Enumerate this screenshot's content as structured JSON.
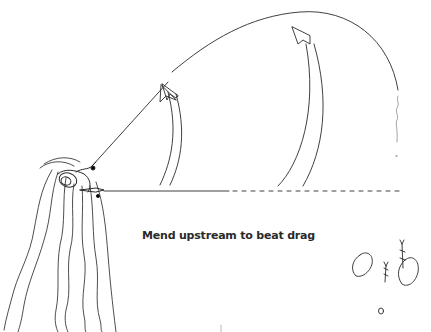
{
  "diagram": {
    "caption": "Mend upstream to beat drag",
    "colors": {
      "background": "#ffffff",
      "ink": "#2a2a2a",
      "faint_ink": "#777777"
    },
    "elements": [
      "angler-in-water",
      "fly-line-cast-arc",
      "mend-arrow-left",
      "mend-arrow-right",
      "straight-line-dashed",
      "rising-fish-rings",
      "water-current-lines"
    ]
  }
}
